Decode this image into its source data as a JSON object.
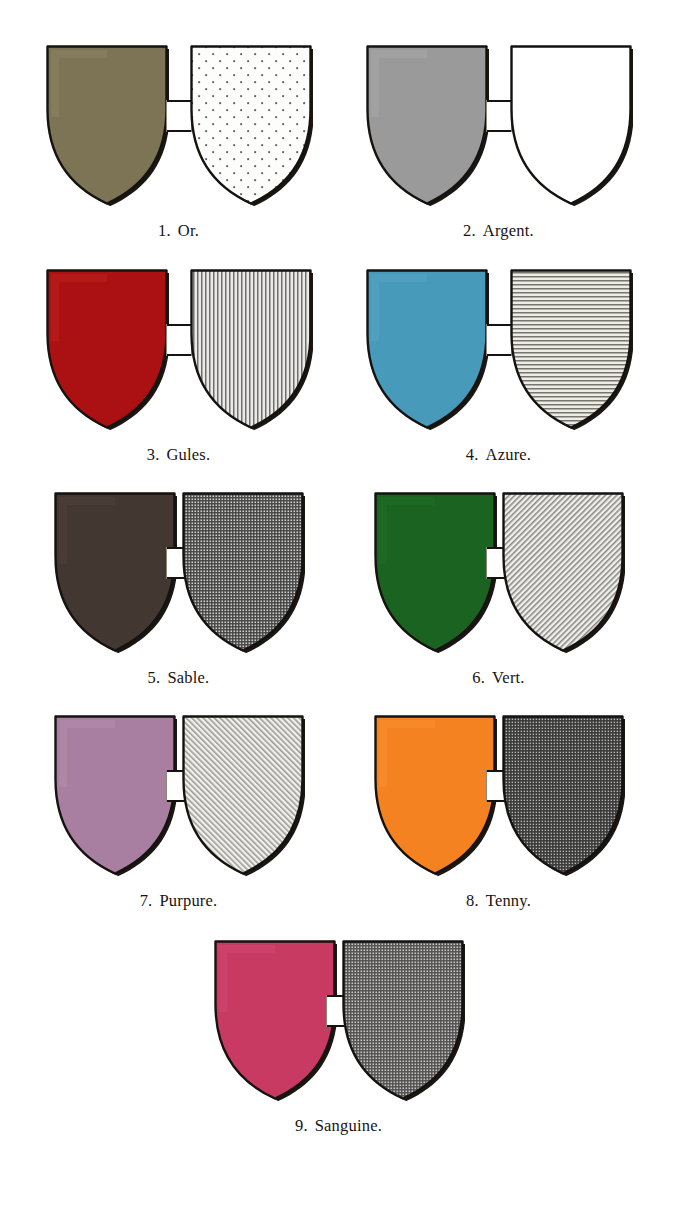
{
  "plate": {
    "title": "Heraldic Tinctures and their Hatchings",
    "background_color": "#ffffff",
    "caption_color": "#17140f",
    "outline_color": "#15120f",
    "shadow_color": "#1a1713",
    "columns": 2,
    "entry_count": 9
  },
  "entries": [
    {
      "number": "1.",
      "name": "Or.",
      "caption": "1. Or.",
      "tincture": "or",
      "color": "#7d7355",
      "highlight": "#8c8363",
      "hatching": "dots",
      "hatching_label": "field of dots",
      "hatching_ink": "#5d5f6b",
      "hatching_ground": "#fdfdfb"
    },
    {
      "number": "2.",
      "name": "Argent.",
      "caption": "2. Argent.",
      "tincture": "argent",
      "color": "#9a9a9a",
      "highlight": "#a8a8a8",
      "hatching": "plain",
      "hatching_label": "plain white",
      "hatching_ink": "#ffffff",
      "hatching_ground": "#ffffff"
    },
    {
      "number": "3.",
      "name": "Gules.",
      "caption": "3. Gules.",
      "tincture": "gules",
      "color": "#ab1113",
      "highlight": "#b8201c",
      "hatching": "vertical",
      "hatching_label": "vertical lines (palewise)",
      "hatching_ink": "#6d6e74",
      "hatching_ground": "#eceae4"
    },
    {
      "number": "4.",
      "name": "Azure.",
      "caption": "4. Azure.",
      "tincture": "azure",
      "color": "#479ab9",
      "highlight": "#55a5c2",
      "hatching": "horizontal",
      "hatching_label": "horizontal lines (fesswise)",
      "hatching_ink": "#76756f",
      "hatching_ground": "#eeece5"
    },
    {
      "number": "5.",
      "name": "Sable.",
      "caption": "5. Sable.",
      "tincture": "sable",
      "color": "#433732",
      "highlight": "#4e413b",
      "hatching": "cross-dense",
      "hatching_label": "dense cross-hatch",
      "hatching_ink": "#4a4a4a",
      "hatching_ground": "#d3d2cd"
    },
    {
      "number": "6.",
      "name": "Vert.",
      "caption": "6. Vert.",
      "tincture": "vert",
      "color": "#1a6320",
      "highlight": "#1f7026",
      "hatching": "diagonal-bend",
      "hatching_label": "diagonal lines (bendwise)",
      "hatching_ink": "#8a8a86",
      "hatching_ground": "#f0efeb"
    },
    {
      "number": "7.",
      "name": "Purpure.",
      "caption": "7. Purpure.",
      "tincture": "purpure",
      "color": "#a87fa0",
      "highlight": "#b48cab",
      "hatching": "diagonal-sinister",
      "hatching_label": "diagonal lines (bend sinister)",
      "hatching_ink": "#9c9b96",
      "hatching_ground": "#f1f0ec"
    },
    {
      "number": "8.",
      "name": "Tenny.",
      "caption": "8. Tenny.",
      "tincture": "tenny",
      "color": "#f58220",
      "highlight": "#f88f2f",
      "hatching": "cross-dark",
      "hatching_label": "dark cross-hatch",
      "hatching_ink": "#3d3d3d",
      "hatching_ground": "#bdbcb8"
    },
    {
      "number": "9.",
      "name": "Sanguine.",
      "caption": "9. Sanguine.",
      "tincture": "sanguine",
      "color": "#c83a62",
      "highlight": "#cf4770",
      "hatching": "cross-medium",
      "hatching_label": "medium cross-hatch",
      "hatching_ink": "#555555",
      "hatching_ground": "#c9c8c4"
    }
  ]
}
